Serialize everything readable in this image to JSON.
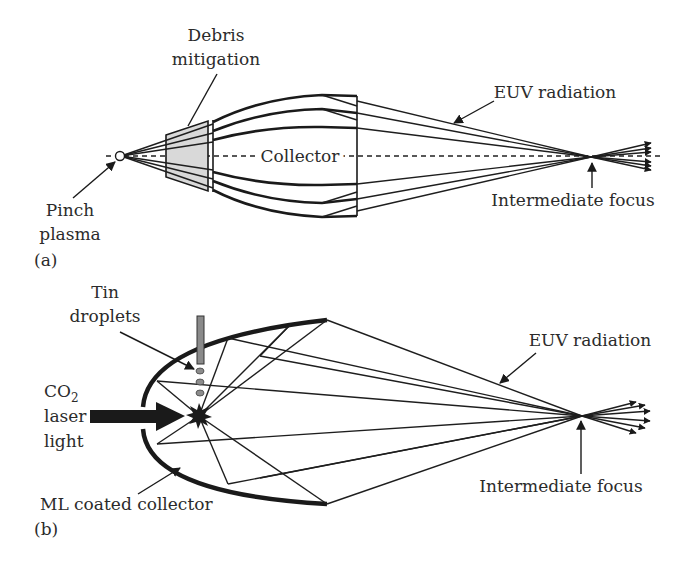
{
  "colors": {
    "ink": "#1a1a1a",
    "text": "#2b2b2b",
    "debris_fill": "#d9d9d9",
    "tin_nozzle": "#8a8a8a",
    "droplet": "#8c8c8c",
    "background": "#ffffff"
  },
  "panel_a": {
    "label": "(a)",
    "debris_mitigation": [
      "Debris",
      "mitigation"
    ],
    "collector": "Collector",
    "euv_radiation": "EUV radiation",
    "intermediate_focus": "Intermediate focus",
    "pinch_plasma": [
      "Pinch",
      "plasma"
    ]
  },
  "panel_b": {
    "label": "(b)",
    "tin_droplets": [
      "Tin",
      "droplets"
    ],
    "co2_laser": [
      "CO",
      "2",
      "laser",
      "light"
    ],
    "euv_radiation": "EUV radiation",
    "intermediate_focus": "Intermediate focus",
    "collector": "ML coated collector"
  }
}
